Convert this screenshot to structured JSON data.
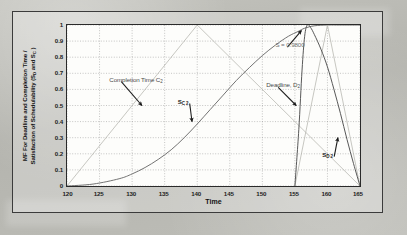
{
  "figure": {
    "name": "membership-function-chart",
    "background_color": "#b9b9b4",
    "plot_background": "#fdfdfb",
    "frame_color": "#3b3b3b"
  },
  "chart_data": {
    "type": "line",
    "title": "",
    "xlabel": "Time",
    "ylabel": "MF For Deadline and Completion Time / Satisfaction of Schedulability (SD and SC )",
    "ylabel_line1": "MF For Deadline and Completion Time /",
    "ylabel_line2": "Satisfaction of Schedulability (S",
    "ylabel_line2_sub1": "D",
    "ylabel_line2_mid": " and S",
    "ylabel_line2_sub2": "C",
    "ylabel_line2_end": " )",
    "xlim": [
      120,
      165
    ],
    "ylim": [
      0,
      1
    ],
    "xticks": [
      120,
      125,
      130,
      135,
      140,
      145,
      150,
      155,
      160,
      165
    ],
    "xticklabels": [
      "120",
      "125",
      "130",
      "135",
      "140",
      "145",
      "150",
      "155",
      "160",
      "165"
    ],
    "yticks": [
      0,
      0.1,
      0.2,
      0.3,
      0.4,
      0.5,
      0.6,
      0.7,
      0.8,
      0.9,
      1
    ],
    "yticklabels": [
      "0",
      "0.1",
      "0.2",
      "0.3",
      "0.4",
      "0.5",
      "0.6",
      "0.7",
      "0.8",
      "0.9",
      "1"
    ],
    "grid": true,
    "grid_style": "dotted",
    "legend": "none",
    "series": [
      {
        "name": "Completion Time C2",
        "style": "light-thin",
        "color": "#b4b4ae",
        "shape": "triangular-membership",
        "points": [
          [
            120,
            0
          ],
          [
            140,
            1
          ],
          [
            165,
            0
          ]
        ]
      },
      {
        "name": "SC2",
        "style": "dark-thin",
        "color": "#6b6b6b",
        "shape": "sigmoid-rise",
        "points": [
          [
            120,
            0
          ],
          [
            124,
            0.012
          ],
          [
            128,
            0.045
          ],
          [
            130,
            0.075
          ],
          [
            132,
            0.115
          ],
          [
            134,
            0.165
          ],
          [
            136,
            0.225
          ],
          [
            138,
            0.3
          ],
          [
            140,
            0.385
          ],
          [
            142,
            0.475
          ],
          [
            144,
            0.565
          ],
          [
            146,
            0.655
          ],
          [
            148,
            0.735
          ],
          [
            150,
            0.81
          ],
          [
            152,
            0.875
          ],
          [
            154,
            0.93
          ],
          [
            155.5,
            0.96
          ],
          [
            156.5,
            0.98
          ],
          [
            158,
            0.995
          ],
          [
            160,
            1.0
          ],
          [
            162,
            1.0
          ],
          [
            165,
            1.0
          ]
        ]
      },
      {
        "name": "Deadline, D2",
        "style": "light-thin",
        "color": "#b4b4ae",
        "shape": "triangular-membership",
        "points": [
          [
            155,
            0
          ],
          [
            160,
            1
          ],
          [
            165,
            0
          ]
        ]
      },
      {
        "name": "SD2",
        "style": "dark-thin",
        "color": "#4f4f4f",
        "shape": "peak-decay",
        "points": [
          [
            155,
            0
          ],
          [
            155.6,
            0.35
          ],
          [
            156.1,
            0.72
          ],
          [
            156.5,
            0.93
          ],
          [
            156.9,
            1.0
          ],
          [
            157.4,
            0.985
          ],
          [
            158,
            0.94
          ],
          [
            159,
            0.85
          ],
          [
            160,
            0.74
          ],
          [
            161,
            0.6
          ],
          [
            162,
            0.45
          ],
          [
            163,
            0.29
          ],
          [
            164,
            0.14
          ],
          [
            165,
            0.0
          ]
        ]
      }
    ],
    "annotations": [
      {
        "name": "completion-time-label",
        "text": "Completion Time C",
        "sub": "2",
        "x": 126.5,
        "y": 0.66,
        "arrow": {
          "to_x": 131.5,
          "to_y": 0.5
        }
      },
      {
        "name": "sc2-label",
        "text": "S",
        "sub": "C 2",
        "x": 137.0,
        "y": 0.525,
        "arrow": {
          "to_x": 139.2,
          "to_y": 0.4
        }
      },
      {
        "name": "s-value-label",
        "text": "S = 0.9800",
        "x": 152.0,
        "y": 0.875,
        "arrow": {
          "to_x": 156.0,
          "to_y": 0.965
        }
      },
      {
        "name": "deadline-label",
        "text": "Deadline, D",
        "sub": "2",
        "x": 150.6,
        "y": 0.625,
        "arrow": {
          "to_x": 155.2,
          "to_y": 0.5
        }
      },
      {
        "name": "sd2-label",
        "text": "S",
        "sub": "D 2",
        "x": 159.2,
        "y": 0.195,
        "arrow": {
          "to_x": 161.6,
          "to_y": 0.3
        }
      }
    ]
  }
}
